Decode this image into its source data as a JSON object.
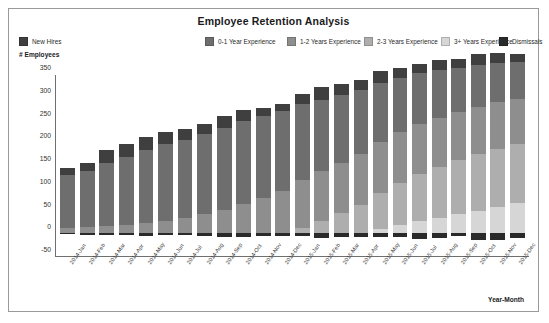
{
  "chart": {
    "title": "Employee Retention Analysis",
    "ylabel": "# Employees",
    "xlabel": "Year-Month"
  },
  "legend": [
    {
      "label": "New Hires",
      "color": "#3f3f3f"
    },
    {
      "label": "0-1 Year Experience",
      "color": "#6e6e6e"
    },
    {
      "label": "1-2 Years Experience",
      "color": "#8e8e8e"
    },
    {
      "label": "2-3 Years Experience",
      "color": "#aeaeae"
    },
    {
      "label": "3+ Years Experience",
      "color": "#d6d6d6"
    },
    {
      "label": "Dismissals",
      "color": "#2a2a2a"
    }
  ],
  "chart_data": {
    "type": "bar",
    "stacked": true,
    "title": "Employee Retention Analysis",
    "xlabel": "Year-Month",
    "ylabel": "# Employees",
    "ylim": [
      -50,
      350
    ],
    "yticks": [
      350,
      300,
      250,
      200,
      150,
      100,
      50,
      0,
      -50
    ],
    "grid": false,
    "legend_position": "top",
    "categories": [
      "2014-Jan",
      "2014-Feb",
      "2014-Mar",
      "2014-Apr",
      "2014-May",
      "2014-Jun",
      "2014-Jul",
      "2014-Aug",
      "2014-Sep",
      "2014-Oct",
      "2014-Nov",
      "2014-Dec",
      "2015-Jan",
      "2015-Feb",
      "2015-Mar",
      "2015-Apr",
      "2015-May",
      "2015-Jun",
      "2015-Jul",
      "2015-Aug",
      "2015-Sep",
      "2015-Oct",
      "2015-Nov",
      "2015-Dec"
    ],
    "series": [
      {
        "name": "3+ Years Experience",
        "color": "#d6d6d6",
        "values": [
          0,
          0,
          0,
          0,
          0,
          0,
          0,
          0,
          0,
          0,
          0,
          0,
          0,
          0,
          0,
          0,
          10,
          18,
          26,
          34,
          42,
          50,
          58,
          66
        ]
      },
      {
        "name": "2-3 Years Experience",
        "color": "#aeaeae",
        "values": [
          0,
          0,
          0,
          0,
          0,
          0,
          0,
          0,
          0,
          0,
          0,
          0,
          12,
          28,
          45,
          62,
          78,
          92,
          104,
          112,
          118,
          124,
          128,
          130
        ]
      },
      {
        "name": "1-2 Years Experience",
        "color": "#8e8e8e",
        "values": [
          12,
          14,
          16,
          18,
          22,
          28,
          34,
          42,
          52,
          64,
          78,
          92,
          104,
          108,
          110,
          112,
          112,
          112,
          110,
          108,
          106,
          104,
          102,
          100
        ]
      },
      {
        "name": "0-1 Year Experience",
        "color": "#6e6e6e",
        "values": [
          115,
          122,
          138,
          150,
          160,
          168,
          172,
          176,
          180,
          182,
          180,
          176,
          168,
          158,
          148,
          140,
          130,
          120,
          112,
          104,
          98,
          92,
          86,
          80
        ]
      },
      {
        "name": "New Hires",
        "color": "#3f3f3f",
        "values": [
          17,
          18,
          30,
          28,
          30,
          27,
          23,
          22,
          25,
          24,
          18,
          16,
          22,
          27,
          25,
          24,
          26,
          22,
          20,
          22,
          20,
          24,
          22,
          18
        ]
      },
      {
        "name": "Dismissals",
        "color": "#2a2a2a",
        "values": [
          -2,
          -3,
          -3,
          -3,
          -5,
          -4,
          -4,
          -6,
          -9,
          -8,
          -7,
          -5,
          -6,
          -10,
          -9,
          -8,
          -9,
          -9,
          -12,
          -10,
          -7,
          -14,
          -15,
          -10
        ]
      }
    ],
    "totals": [
      144,
      154,
      184,
      196,
      212,
      223,
      229,
      240,
      257,
      270,
      276,
      284,
      306,
      321,
      328,
      338,
      356,
      364,
      372,
      380,
      384,
      394,
      396,
      394
    ]
  }
}
